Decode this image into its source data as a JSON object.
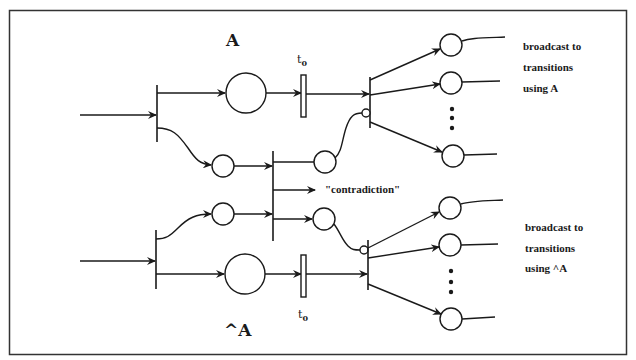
{
  "diagram": {
    "type": "petri-net",
    "labels": {
      "place_a": "A",
      "place_not_a": "^A",
      "t0_top": "t",
      "t0_top_sub": "0",
      "t0_bottom": "t",
      "t0_bottom_sub": "0",
      "contradiction": "\"contradiction\"",
      "broadcast_a": [
        "broadcast to",
        "transitions",
        "using A"
      ],
      "broadcast_not_a": [
        "broadcast to",
        "transitions",
        "using ^A"
      ]
    },
    "colors": {
      "stroke": "#1a1a1a",
      "background": "#ffffff",
      "border": "#333333"
    },
    "places": [
      {
        "id": "place-a",
        "cx": 246,
        "cy": 93,
        "r": 20
      },
      {
        "id": "place-not-a",
        "cx": 245,
        "cy": 274,
        "r": 20
      },
      {
        "id": "place-a-copy",
        "cx": 223,
        "cy": 166,
        "r": 11
      },
      {
        "id": "place-not-a-copy",
        "cx": 223,
        "cy": 214,
        "r": 11
      },
      {
        "id": "place-a-guard",
        "cx": 325,
        "cy": 162,
        "r": 11
      },
      {
        "id": "place-not-a-guard",
        "cx": 324,
        "cy": 219,
        "r": 11
      },
      {
        "id": "place-out-a-1",
        "cx": 451,
        "cy": 45,
        "r": 11
      },
      {
        "id": "place-out-a-2",
        "cx": 451,
        "cy": 83,
        "r": 11
      },
      {
        "id": "place-out-a-n",
        "cx": 453,
        "cy": 156,
        "r": 11
      },
      {
        "id": "place-out-not-a-1",
        "cx": 450,
        "cy": 208,
        "r": 11
      },
      {
        "id": "place-out-not-a-2",
        "cx": 450,
        "cy": 245,
        "r": 11
      },
      {
        "id": "place-out-not-a-n",
        "cx": 451,
        "cy": 319,
        "r": 11
      }
    ]
  }
}
